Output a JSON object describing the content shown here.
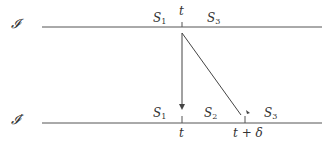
{
  "diagram": {
    "frames": [
      {
        "id": "I",
        "label": "𝓘",
        "prime": ""
      },
      {
        "id": "I_prime",
        "label": "𝓘",
        "prime": "′"
      }
    ],
    "top_labels": {
      "s1": "S",
      "s1_sub": "1",
      "t": "t",
      "s3": "S",
      "s3_sub": "3"
    },
    "bottom_labels": {
      "s1": "S",
      "s1_sub": "1",
      "s2": "S",
      "s2_sub": "2",
      "s3": "S",
      "s3_sub": "3",
      "t": "t",
      "t_delta": "t + δ"
    },
    "line_color": "#555555"
  }
}
